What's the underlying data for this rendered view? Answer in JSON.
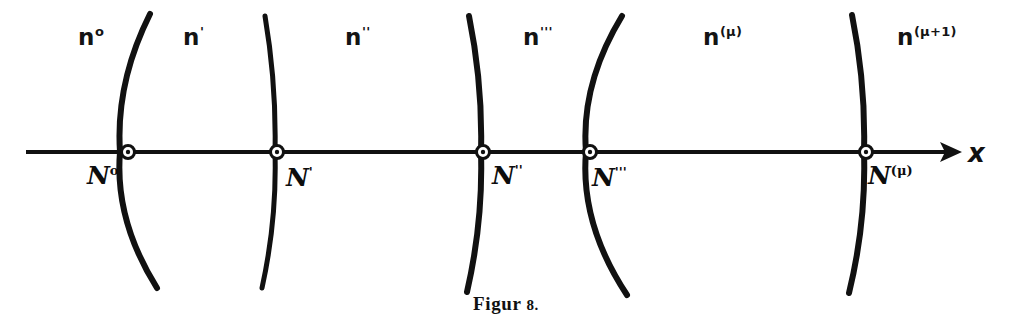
{
  "figure": {
    "caption_text": "Figur",
    "caption_number": "8.",
    "background_color": "#ffffff",
    "ink_color": "#111111"
  },
  "axis": {
    "name": "x-axis",
    "label": "x",
    "label_x": 968,
    "label_y": 140,
    "y": 152,
    "x_start": 26,
    "x_end": 962,
    "arrow_tip_x": 962,
    "stroke_width": 4
  },
  "regions": [
    {
      "id": "region-n-0",
      "base": "n",
      "sup": "o",
      "x": 78,
      "y": 25
    },
    {
      "id": "region-n-1",
      "base": "n",
      "sup": "'",
      "x": 183,
      "y": 25
    },
    {
      "id": "region-n-2",
      "base": "n",
      "sup": "''",
      "x": 345,
      "y": 25
    },
    {
      "id": "region-n-3",
      "base": "n",
      "sup": "'''",
      "x": 523,
      "y": 25
    },
    {
      "id": "region-n-mu",
      "base": "n",
      "sup": "(μ)",
      "x": 703,
      "y": 25
    },
    {
      "id": "region-n-mu-1",
      "base": "n",
      "sup": "(μ+1)",
      "x": 897,
      "y": 25
    }
  ],
  "nodes": [
    {
      "id": "node-N-0",
      "base": "N",
      "sup": "o",
      "marker_x": 128,
      "marker_y": 152,
      "label_x": 87,
      "label_y": 163
    },
    {
      "id": "node-N-1",
      "base": "N",
      "sup": "'",
      "marker_x": 277,
      "marker_y": 152,
      "label_x": 286,
      "label_y": 165
    },
    {
      "id": "node-N-2",
      "base": "N",
      "sup": "''",
      "marker_x": 483,
      "marker_y": 152,
      "label_x": 492,
      "label_y": 163
    },
    {
      "id": "node-N-3",
      "base": "N",
      "sup": "'''",
      "marker_x": 590,
      "marker_y": 152,
      "label_x": 592,
      "label_y": 165
    },
    {
      "id": "node-N-mu",
      "base": "N",
      "sup": "(μ)",
      "marker_x": 866,
      "marker_y": 152,
      "label_x": 868,
      "label_y": 163
    }
  ],
  "wavefronts": [
    {
      "id": "wavefront-0",
      "top_x": 150,
      "top_y": 14,
      "mid_x": 120,
      "mid_y": 152,
      "bottom_x": 157,
      "bottom_y": 288,
      "stroke_width": 6
    },
    {
      "id": "wavefront-1",
      "top_x": 265,
      "top_y": 16,
      "mid_x": 275,
      "mid_y": 152,
      "bottom_x": 262,
      "bottom_y": 288,
      "stroke_width": 5
    },
    {
      "id": "wavefront-2",
      "top_x": 469,
      "top_y": 16,
      "mid_x": 481,
      "mid_y": 152,
      "bottom_x": 467,
      "bottom_y": 292,
      "stroke_width": 6
    },
    {
      "id": "wavefront-3",
      "top_x": 622,
      "top_y": 16,
      "mid_x": 586,
      "mid_y": 152,
      "bottom_x": 627,
      "bottom_y": 295,
      "stroke_width": 6
    },
    {
      "id": "wavefront-4",
      "top_x": 852,
      "top_y": 15,
      "mid_x": 864,
      "mid_y": 152,
      "bottom_x": 849,
      "bottom_y": 293,
      "stroke_width": 6
    }
  ],
  "chart_data": {
    "type": "diagram",
    "title": "Figur 8.",
    "xlabel": "x",
    "ylabel": "",
    "grid": false,
    "legend": "none",
    "axis_y_pixel": 152,
    "node_positions_x": [
      128,
      277,
      483,
      590,
      866
    ],
    "node_labels": [
      "N⁰",
      "N′",
      "N″",
      "N‴",
      "N⁽ᵟ⁾"
    ],
    "region_labels": [
      "n⁰",
      "n′",
      "n″",
      "n‴",
      "n⁽ᵟ⁾",
      "n⁽ᵟ⁺¹⁾"
    ],
    "region_centers_x": [
      90,
      200,
      370,
      545,
      730,
      930
    ],
    "series": [
      {
        "name": "wavefront-0",
        "x_at_axis": 128
      },
      {
        "name": "wavefront-1",
        "x_at_axis": 277
      },
      {
        "name": "wavefront-2",
        "x_at_axis": 483
      },
      {
        "name": "wavefront-3",
        "x_at_axis": 590
      },
      {
        "name": "wavefront-4",
        "x_at_axis": 866
      }
    ]
  }
}
